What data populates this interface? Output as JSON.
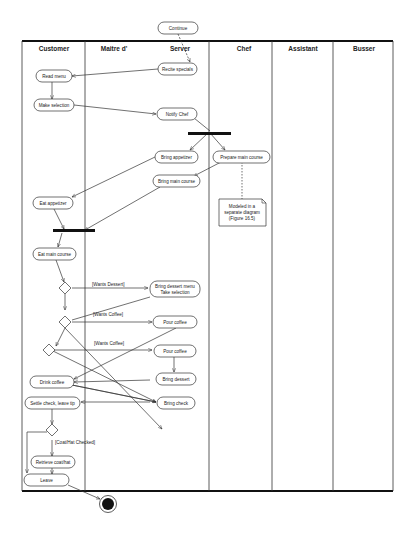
{
  "diagram": {
    "type": "uml-activity-diagram-swimlanes",
    "swimlanes": [
      {
        "id": "customer",
        "label": "Customer",
        "x0": 22,
        "x1": 85
      },
      {
        "id": "maitre",
        "label": "Maitre d'",
        "x0": 85,
        "x1": 209
      },
      {
        "id": "server",
        "label": "Server",
        "x0": 85,
        "x1": 209
      },
      {
        "id": "chef",
        "label": "Chef",
        "x0": 209,
        "x1": 272
      },
      {
        "id": "assistant",
        "label": "Assistant",
        "x0": 272,
        "x1": 333
      },
      {
        "id": "busser",
        "label": "Busser",
        "x0": 333,
        "x1": 393
      }
    ],
    "nodes": {
      "continue": {
        "label": "Continue",
        "lane": "server"
      },
      "recite_specials": {
        "label": "Recite specials",
        "lane": "server"
      },
      "read_menu": {
        "label": "Read menu",
        "lane": "customer"
      },
      "make_selection": {
        "label": "Make selection",
        "lane": "customer"
      },
      "notify_chef": {
        "label": "Notify Chef",
        "lane": "server"
      },
      "bring_appetizer": {
        "label": "Bring appetizer",
        "lane": "server"
      },
      "prepare_main_course": {
        "label": "Prepare main course",
        "lane": "chef"
      },
      "bring_main_course": {
        "label": "Bring main course",
        "lane": "server"
      },
      "eat_appetizer": {
        "label": "Eat appetizer",
        "lane": "customer"
      },
      "eat_main_course": {
        "label": "Eat main course",
        "lane": "customer"
      },
      "bring_dessert_menu_line1": {
        "label": "Bring dessert menu",
        "lane": "server"
      },
      "bring_dessert_menu_line2": {
        "label": "Take selection",
        "lane": "server"
      },
      "pour_coffee_1": {
        "label": "Pour coffee",
        "lane": "server"
      },
      "pour_coffee_2": {
        "label": "Pour coffee",
        "lane": "server"
      },
      "bring_dessert": {
        "label": "Bring dessert",
        "lane": "server"
      },
      "drink_coffee": {
        "label": "Drink coffee",
        "lane": "customer"
      },
      "bring_check": {
        "label": "Bring check",
        "lane": "server"
      },
      "settle_check": {
        "label": "Settle check, leave tip",
        "lane": "customer"
      },
      "retrieve_coat": {
        "label": "Retrieve coat/hat",
        "lane": "customer"
      },
      "leave": {
        "label": "Leave",
        "lane": "customer"
      }
    },
    "guards": {
      "wants_dessert": "[Wants Dessert]",
      "wants_coffee_1": "[Wants Coffee]",
      "wants_coffee_2": "[Wants Coffee]",
      "coat_checked": "[Coat/Hat Checked]"
    },
    "note": {
      "line1": "Modeled in a",
      "line2": "separate diagram",
      "line3": "(Figure 16.5)"
    },
    "colors": {
      "line": "#333333",
      "bar": "#111111",
      "background": "#ffffff"
    }
  }
}
